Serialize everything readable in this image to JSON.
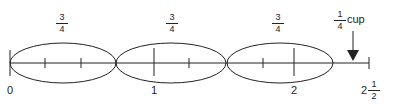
{
  "diagram": {
    "segment_labels": [
      {
        "num": "3",
        "den": "4"
      },
      {
        "num": "3",
        "den": "4"
      },
      {
        "num": "3",
        "den": "4"
      }
    ],
    "axis_labels": [
      "0",
      "1",
      "2"
    ],
    "end_label": {
      "whole": "2",
      "num": "1",
      "den": "2"
    },
    "pointer": {
      "num": "1",
      "den": "4",
      "unit": "cup"
    },
    "colors": {
      "stroke": "#222222",
      "background": "#ffffff"
    }
  }
}
